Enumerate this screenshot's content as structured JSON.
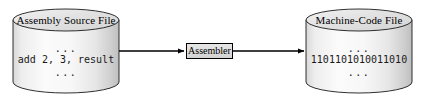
{
  "diagram": {
    "type": "assembly-to-machine-code-flow",
    "nodes": [
      {
        "id": "source-file",
        "shape": "cylinder",
        "title": "Assembly Source File",
        "lines": [
          "...",
          "add 2, 3, result",
          "..."
        ],
        "code_line": "add 2, 3, result",
        "ellipsis_top": "...",
        "ellipsis_bottom": "..."
      },
      {
        "id": "assembler",
        "shape": "rectangle",
        "label": "Assembler"
      },
      {
        "id": "machine-code-file",
        "shape": "cylinder",
        "title": "Machine-Code File",
        "lines": [
          "...",
          "1101101010011010",
          "..."
        ],
        "code_line": "1101101010011010",
        "ellipsis_top": "...",
        "ellipsis_bottom": "..."
      }
    ],
    "edges": [
      {
        "id": "edge-source-to-assembler",
        "from": "source-file",
        "to": "assembler",
        "label": ""
      },
      {
        "id": "edge-assembler-to-machine",
        "from": "assembler",
        "to": "machine-code-file",
        "label": ""
      }
    ],
    "colors": {
      "outline": "#1a1a1a",
      "cylinder_fill_light": "#fbfbfb",
      "cylinder_fill_mid": "#f0f0f0",
      "cylinder_fill_dark": "#c8c8c8",
      "cylinder_top_fill": "#e4e4e4",
      "box_fill": "#dcdcdc",
      "arrow": "#000000",
      "text": "#000000",
      "background": "#ffffff"
    }
  }
}
